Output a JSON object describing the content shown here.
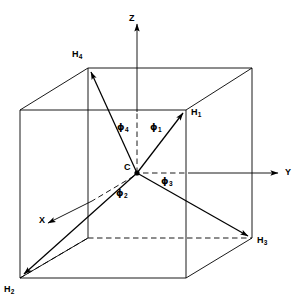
{
  "figure": {
    "type": "3d-line-diagram",
    "background_color": "#ffffff",
    "line_color": "#000000",
    "axes": [
      {
        "name": "Z",
        "label": "Z",
        "direction": "up",
        "label_x": 129,
        "label_y": 14
      },
      {
        "name": "Y",
        "label": "Y",
        "direction": "right",
        "label_x": 285,
        "label_y": 168
      },
      {
        "name": "X",
        "label": "X",
        "direction": "down-left",
        "label_x": 39,
        "label_y": 226
      }
    ],
    "center": {
      "label": "C",
      "x": 137,
      "y": 173,
      "label_x": 124,
      "label_y": 163
    },
    "atoms": [
      {
        "label": "H",
        "sub": "1",
        "x": 186,
        "y": 110,
        "label_x": 191,
        "label_y": 113,
        "corner": "front-top-right"
      },
      {
        "label": "H",
        "sub": "2",
        "x": 20,
        "y": 278,
        "label_x": 4,
        "label_y": 288,
        "corner": "front-bottom-left"
      },
      {
        "label": "H",
        "sub": "3",
        "x": 252,
        "y": 238,
        "label_x": 257,
        "label_y": 241,
        "corner": "back-bottom-right"
      },
      {
        "label": "H",
        "sub": "4",
        "x": 88,
        "y": 68,
        "label_x": 72,
        "label_y": 53,
        "corner": "back-top-left"
      }
    ],
    "angles": [
      {
        "label": "ϕ",
        "sub": "1",
        "label_x": 152,
        "label_y": 126
      },
      {
        "label": "ϕ",
        "sub": "2",
        "label_x": 118,
        "label_y": 192
      },
      {
        "label": "ϕ",
        "sub": "3",
        "label_x": 163,
        "label_y": 180
      },
      {
        "label": "ϕ",
        "sub": "4",
        "label_x": 119,
        "label_y": 127
      }
    ],
    "cube": {
      "front": {
        "tl": [
          20,
          110
        ],
        "tr": [
          186,
          110
        ],
        "br": [
          186,
          278
        ],
        "bl": [
          20,
          278
        ]
      },
      "back": {
        "tl": [
          88,
          68
        ],
        "tr": [
          252,
          68
        ],
        "br": [
          252,
          238
        ],
        "bl": [
          88,
          238
        ]
      }
    }
  }
}
